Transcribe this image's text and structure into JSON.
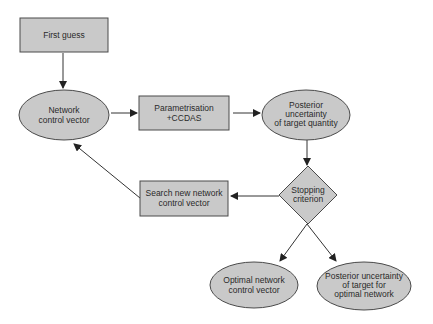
{
  "diagram": {
    "type": "flowchart",
    "colors": {
      "fill": "#c9c9c9",
      "stroke": "#4a4a4a",
      "arrow": "#333333",
      "text": "#2a2a2a"
    },
    "nodes": {
      "first_guess": {
        "shape": "rectangle",
        "lines": [
          "First guess"
        ]
      },
      "network_control_vector": {
        "shape": "ellipse",
        "lines": [
          "Network",
          "control vector"
        ]
      },
      "parametrisation": {
        "shape": "rectangle",
        "lines": [
          "Parametrisation",
          "+CCDAS"
        ]
      },
      "posterior_uncertainty": {
        "shape": "ellipse",
        "lines": [
          "Posterior",
          "uncertainty",
          "of target quantity"
        ]
      },
      "stopping_criterion": {
        "shape": "diamond",
        "lines": [
          "Stopping",
          "criterion"
        ]
      },
      "search_new": {
        "shape": "rectangle",
        "lines": [
          "Search new network",
          "control vector"
        ]
      },
      "optimal_network": {
        "shape": "ellipse",
        "lines": [
          "Optimal network",
          "control vector"
        ]
      },
      "posterior_optimal": {
        "shape": "ellipse",
        "lines": [
          "Posterior uncertainty",
          "of target for",
          "optimal network"
        ]
      }
    },
    "edges": [
      {
        "from": "first_guess",
        "to": "network_control_vector"
      },
      {
        "from": "network_control_vector",
        "to": "parametrisation"
      },
      {
        "from": "parametrisation",
        "to": "posterior_uncertainty"
      },
      {
        "from": "posterior_uncertainty",
        "to": "stopping_criterion"
      },
      {
        "from": "stopping_criterion",
        "to": "search_new"
      },
      {
        "from": "search_new",
        "to": "network_control_vector"
      },
      {
        "from": "stopping_criterion",
        "to": "optimal_network"
      },
      {
        "from": "stopping_criterion",
        "to": "posterior_optimal"
      }
    ]
  }
}
